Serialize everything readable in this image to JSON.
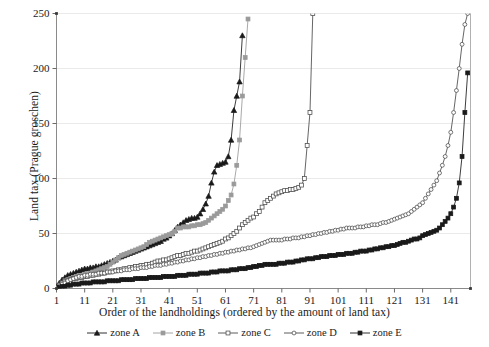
{
  "axes": {
    "ylabel": "Land tax (Prague groschen)",
    "xlabel": "Order of the landholdings (ordered by the amount of land tax)",
    "yticks": [
      "0",
      "50",
      "100",
      "150",
      "200",
      "250"
    ],
    "xticks": [
      "1",
      "11",
      "21",
      "31",
      "41",
      "51",
      "61",
      "71",
      "81",
      "91",
      "101",
      "111",
      "121",
      "131",
      "141"
    ]
  },
  "legend": {
    "items": [
      {
        "label": "zone A",
        "marker": "filled-triangle-marker",
        "color": "#1a1a1a"
      },
      {
        "label": "zone B",
        "marker": "filled-square-marker",
        "color": "#9a9a9a"
      },
      {
        "label": "zone C",
        "marker": "open-square-marker",
        "color": "#4a4a4a"
      },
      {
        "label": "zone D",
        "marker": "open-circle-marker",
        "color": "#4a4a4a"
      },
      {
        "label": "zone E",
        "marker": "filled-square-marker",
        "color": "#1a1a1a"
      }
    ]
  },
  "chart_data": {
    "type": "line",
    "title": "",
    "xlabel": "Order of the landholdings (ordered by the amount of land tax)",
    "ylabel": "Land tax (Prague groschen)",
    "xlim": [
      1,
      148
    ],
    "ylim": [
      0,
      250
    ],
    "grid": "horizontal",
    "legend_position": "bottom",
    "ytick_values": [
      0,
      50,
      100,
      150,
      200,
      250
    ],
    "xtick_values": [
      1,
      11,
      21,
      31,
      41,
      51,
      61,
      71,
      81,
      91,
      101,
      111,
      121,
      131,
      141
    ],
    "note": "Each series is a sorted (ascending) distribution of land tax per landholding within a zone. Series A and B are truncated by the top of the axis.",
    "series": [
      {
        "name": "zone A",
        "marker": "filled-triangle",
        "color": "#1a1a1a",
        "x": [
          1,
          2,
          3,
          4,
          5,
          6,
          7,
          8,
          9,
          10,
          11,
          12,
          13,
          14,
          15,
          16,
          17,
          18,
          19,
          20,
          21,
          22,
          23,
          24,
          25,
          26,
          27,
          28,
          29,
          30,
          31,
          32,
          33,
          34,
          35,
          36,
          37,
          38,
          39,
          40,
          41,
          42,
          43,
          44,
          45,
          46,
          47,
          48,
          49,
          50,
          51,
          52,
          53,
          54,
          55,
          56,
          57,
          58,
          59,
          60,
          61,
          62,
          63,
          64,
          65,
          66,
          67
        ],
        "y": [
          2,
          5,
          8,
          10,
          12,
          13,
          14,
          15,
          16,
          17,
          18,
          18,
          19,
          19,
          20,
          20,
          21,
          22,
          23,
          24,
          25,
          26,
          28,
          29,
          30,
          31,
          32,
          33,
          34,
          35,
          36,
          37,
          38,
          39,
          40,
          41,
          42,
          43,
          45,
          46,
          48,
          50,
          53,
          56,
          58,
          60,
          62,
          63,
          64,
          64,
          65,
          68,
          72,
          77,
          84,
          96,
          106,
          112,
          113,
          114,
          115,
          120,
          135,
          162,
          175,
          188,
          230
        ]
      },
      {
        "name": "zone B",
        "marker": "filled-square",
        "color": "#9a9a9a",
        "x": [
          1,
          2,
          3,
          4,
          5,
          6,
          7,
          8,
          9,
          10,
          11,
          12,
          13,
          14,
          15,
          16,
          17,
          18,
          19,
          20,
          21,
          22,
          23,
          24,
          25,
          26,
          27,
          28,
          29,
          30,
          31,
          32,
          33,
          34,
          35,
          36,
          37,
          38,
          39,
          40,
          41,
          42,
          43,
          44,
          45,
          46,
          47,
          48,
          49,
          50,
          51,
          52,
          53,
          54,
          55,
          56,
          57,
          58,
          59,
          60,
          61,
          62,
          63,
          64,
          65,
          66,
          67,
          68,
          69
        ],
        "y": [
          1,
          3,
          5,
          7,
          8,
          9,
          10,
          11,
          12,
          12,
          13,
          13,
          14,
          15,
          16,
          17,
          18,
          19,
          20,
          22,
          24,
          26,
          28,
          30,
          31,
          32,
          33,
          34,
          35,
          36,
          37,
          38,
          40,
          42,
          43,
          44,
          45,
          46,
          47,
          48,
          49,
          50,
          52,
          55,
          55,
          56,
          56,
          56,
          57,
          57,
          58,
          58,
          59,
          60,
          62,
          64,
          66,
          68,
          70,
          72,
          75,
          80,
          85,
          95,
          112,
          135,
          175,
          210,
          245
        ]
      },
      {
        "name": "zone C",
        "marker": "open-square",
        "color": "#4a4a4a",
        "x": [
          1,
          2,
          3,
          4,
          5,
          6,
          7,
          8,
          9,
          10,
          11,
          12,
          13,
          14,
          15,
          16,
          17,
          18,
          19,
          20,
          21,
          22,
          23,
          24,
          25,
          26,
          27,
          28,
          29,
          30,
          31,
          32,
          33,
          34,
          35,
          36,
          37,
          38,
          39,
          40,
          41,
          42,
          43,
          44,
          45,
          46,
          47,
          48,
          49,
          50,
          51,
          52,
          53,
          54,
          55,
          56,
          57,
          58,
          59,
          60,
          61,
          62,
          63,
          64,
          65,
          66,
          67,
          68,
          69,
          70,
          71,
          72,
          73,
          74,
          75,
          76,
          77,
          78,
          79,
          80,
          81,
          82,
          83,
          84,
          85,
          86,
          87,
          88,
          89,
          90,
          91,
          92
        ],
        "y": [
          1,
          3,
          5,
          6,
          7,
          8,
          9,
          9,
          10,
          10,
          11,
          11,
          12,
          12,
          13,
          13,
          14,
          14,
          15,
          15,
          16,
          16,
          17,
          17,
          18,
          18,
          19,
          19,
          20,
          20,
          21,
          21,
          22,
          22,
          23,
          24,
          25,
          25,
          26,
          26,
          27,
          28,
          29,
          30,
          30,
          31,
          32,
          32,
          33,
          34,
          34,
          35,
          36,
          37,
          38,
          39,
          40,
          41,
          42,
          43,
          45,
          46,
          48,
          50,
          52,
          55,
          58,
          60,
          62,
          64,
          65,
          68,
          70,
          74,
          78,
          80,
          82,
          84,
          86,
          87,
          88,
          89,
          89,
          90,
          90,
          91,
          92,
          94,
          100,
          130,
          160,
          250
        ]
      },
      {
        "name": "zone D",
        "marker": "open-circle",
        "color": "#4a4a4a",
        "x": [
          1,
          2,
          3,
          4,
          5,
          6,
          7,
          8,
          9,
          10,
          11,
          12,
          13,
          14,
          15,
          16,
          17,
          18,
          19,
          20,
          21,
          22,
          23,
          24,
          25,
          26,
          27,
          28,
          29,
          30,
          31,
          32,
          33,
          34,
          35,
          36,
          37,
          38,
          39,
          40,
          41,
          42,
          43,
          44,
          45,
          46,
          47,
          48,
          49,
          50,
          51,
          52,
          53,
          54,
          55,
          56,
          57,
          58,
          59,
          60,
          61,
          62,
          63,
          64,
          65,
          66,
          67,
          68,
          69,
          70,
          71,
          72,
          73,
          74,
          75,
          76,
          77,
          78,
          79,
          80,
          81,
          82,
          83,
          84,
          85,
          86,
          87,
          88,
          89,
          90,
          91,
          92,
          93,
          94,
          95,
          96,
          97,
          98,
          99,
          100,
          101,
          102,
          103,
          104,
          105,
          106,
          107,
          108,
          109,
          110,
          111,
          112,
          113,
          114,
          115,
          116,
          117,
          118,
          119,
          120,
          121,
          122,
          123,
          124,
          125,
          126,
          127,
          128,
          129,
          130,
          131,
          132,
          133,
          134,
          135,
          136,
          137,
          138,
          139,
          140,
          141,
          142,
          143,
          144,
          145,
          146,
          147
        ],
        "y": [
          1,
          2,
          4,
          5,
          7,
          8,
          9,
          10,
          11,
          11,
          12,
          12,
          13,
          13,
          13,
          14,
          14,
          14,
          15,
          15,
          15,
          16,
          16,
          16,
          17,
          17,
          17,
          18,
          18,
          18,
          19,
          19,
          19,
          20,
          20,
          21,
          21,
          21,
          22,
          22,
          23,
          23,
          24,
          24,
          25,
          25,
          26,
          26,
          27,
          27,
          28,
          28,
          29,
          29,
          30,
          30,
          31,
          31,
          32,
          32,
          33,
          33,
          34,
          34,
          35,
          35,
          36,
          36,
          37,
          37,
          38,
          39,
          40,
          41,
          42,
          43,
          44,
          44,
          44,
          44,
          44,
          45,
          45,
          45,
          46,
          46,
          46,
          47,
          47,
          48,
          48,
          49,
          49,
          50,
          50,
          51,
          51,
          52,
          52,
          53,
          53,
          54,
          54,
          55,
          55,
          55,
          55,
          56,
          56,
          56,
          57,
          57,
          58,
          58,
          58,
          59,
          60,
          60,
          61,
          62,
          63,
          64,
          65,
          66,
          67,
          68,
          70,
          72,
          74,
          76,
          78,
          82,
          86,
          90,
          94,
          98,
          105,
          112,
          120,
          130,
          142,
          160,
          180,
          200,
          222,
          240,
          250
        ]
      },
      {
        "name": "zone E",
        "marker": "filled-square",
        "color": "#1a1a1a",
        "x": [
          1,
          2,
          3,
          4,
          5,
          6,
          7,
          8,
          9,
          10,
          11,
          12,
          13,
          14,
          15,
          16,
          17,
          18,
          19,
          20,
          21,
          22,
          23,
          24,
          25,
          26,
          27,
          28,
          29,
          30,
          31,
          32,
          33,
          34,
          35,
          36,
          37,
          38,
          39,
          40,
          41,
          42,
          43,
          44,
          45,
          46,
          47,
          48,
          49,
          50,
          51,
          52,
          53,
          54,
          55,
          56,
          57,
          58,
          59,
          60,
          61,
          62,
          63,
          64,
          65,
          66,
          67,
          68,
          69,
          70,
          71,
          72,
          73,
          74,
          75,
          76,
          77,
          78,
          79,
          80,
          81,
          82,
          83,
          84,
          85,
          86,
          87,
          88,
          89,
          90,
          91,
          92,
          93,
          94,
          95,
          96,
          97,
          98,
          99,
          100,
          101,
          102,
          103,
          104,
          105,
          106,
          107,
          108,
          109,
          110,
          111,
          112,
          113,
          114,
          115,
          116,
          117,
          118,
          119,
          120,
          121,
          122,
          123,
          124,
          125,
          126,
          127,
          128,
          129,
          130,
          131,
          132,
          133,
          134,
          135,
          136,
          137,
          138,
          139,
          140,
          141,
          142,
          143,
          144,
          145,
          146,
          147
        ],
        "y": [
          1,
          1,
          2,
          2,
          3,
          3,
          4,
          4,
          4,
          5,
          5,
          5,
          5,
          6,
          6,
          6,
          6,
          6,
          7,
          7,
          7,
          7,
          7,
          8,
          8,
          8,
          8,
          8,
          9,
          9,
          9,
          9,
          9,
          10,
          10,
          10,
          10,
          10,
          11,
          11,
          11,
          11,
          11,
          12,
          12,
          12,
          12,
          13,
          13,
          13,
          13,
          14,
          14,
          14,
          14,
          15,
          15,
          15,
          16,
          16,
          16,
          16,
          17,
          17,
          17,
          18,
          18,
          18,
          19,
          19,
          20,
          20,
          21,
          21,
          22,
          22,
          22,
          22,
          22,
          23,
          23,
          23,
          24,
          24,
          24,
          25,
          25,
          26,
          26,
          27,
          27,
          27,
          28,
          28,
          29,
          29,
          29,
          30,
          30,
          30,
          31,
          31,
          31,
          32,
          32,
          32,
          33,
          33,
          34,
          34,
          34,
          35,
          35,
          36,
          36,
          37,
          37,
          38,
          38,
          39,
          39,
          40,
          41,
          42,
          42,
          43,
          44,
          45,
          45,
          46,
          48,
          49,
          50,
          51,
          52,
          53,
          55,
          58,
          61,
          64,
          68,
          74,
          82,
          96,
          120,
          160,
          196
        ]
      }
    ]
  }
}
